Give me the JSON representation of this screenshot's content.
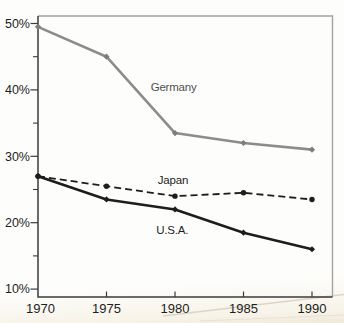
{
  "figure": {
    "background": "#fdfdfc",
    "bottom_tint": "#efe9d9",
    "plot_border_color": "#a3a3a3",
    "axis_color": "#3b3b3b",
    "tick_label_color": "#1e1e1e",
    "artifact_line_color": "#d8d2c1",
    "artifact_line2_color": "#e5dfcf"
  },
  "chart_data": {
    "type": "line",
    "title": "",
    "xlabel": "",
    "ylabel": "",
    "x": [
      1970,
      1975,
      1980,
      1985,
      1990
    ],
    "x_tick_labels": [
      "1970",
      "1975",
      "1980",
      "1985",
      "1990"
    ],
    "y_ticks": [
      10,
      20,
      30,
      40,
      50
    ],
    "y_tick_labels": [
      "10%",
      "20%",
      "30%",
      "40%",
      "50%"
    ],
    "y_minor_ticks": [
      15,
      25,
      35,
      45
    ],
    "xlim": [
      1970,
      1991.5
    ],
    "ylim": [
      10,
      50
    ],
    "grid": false,
    "legend_position": "inline-labels",
    "series": [
      {
        "name": "Germany",
        "values": [
          49.5,
          45,
          33.5,
          32,
          31
        ],
        "color": "#8c8c8c",
        "line_style": "solid",
        "line_width": 2.6,
        "marker": "diamond",
        "marker_color": "#7d7d7d",
        "label": "Germany",
        "label_color": "#4f4f4f",
        "label_at": {
          "year": 1979.9,
          "value": 40.5
        }
      },
      {
        "name": "Japan",
        "values": [
          27,
          25.5,
          24,
          24.5,
          23.5
        ],
        "color": "#1d1d1d",
        "line_style": "dashed",
        "line_width": 1.8,
        "marker": "circle",
        "marker_color": "#1d1d1d",
        "label": "Japan",
        "label_color": "#1d1d1d",
        "label_at": {
          "year": 1979.85,
          "value": 26.4
        }
      },
      {
        "name": "U.S.A.",
        "values": [
          27,
          23.5,
          22,
          18.5,
          16
        ],
        "color": "#1d1d1d",
        "line_style": "solid",
        "line_width": 2.6,
        "marker": "diamond",
        "marker_color": "#1d1d1d",
        "label": "U.S.A.",
        "label_color": "#1d1d1d",
        "label_at": {
          "year": 1979.8,
          "value": 18.9
        }
      }
    ]
  }
}
